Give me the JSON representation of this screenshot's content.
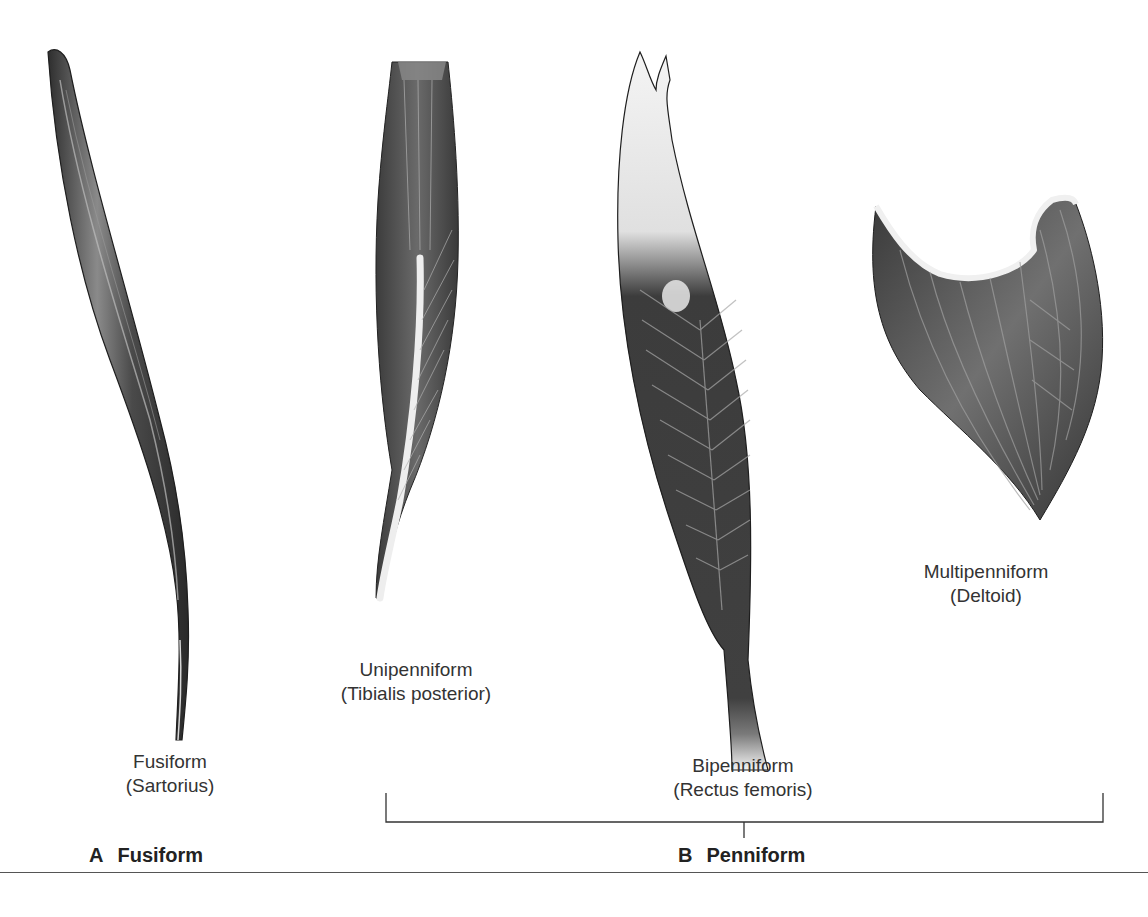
{
  "figure": {
    "muscles": [
      {
        "id": "fusiform",
        "name": "Fusiform",
        "example": "(Sartorius)"
      },
      {
        "id": "unipenniform",
        "name": "Unipenniform",
        "example": "(Tibialis posterior)"
      },
      {
        "id": "bipenniform",
        "name": "Bipenniform",
        "example": "(Rectus femoris)"
      },
      {
        "id": "multipenniform",
        "name": "Multipenniform",
        "example": "(Deltoid)"
      }
    ],
    "panels": [
      {
        "letter": "A",
        "title": "Fusiform"
      },
      {
        "letter": "B",
        "title": "Penniform"
      }
    ],
    "colors": {
      "muscle_dark": "#3a3a3a",
      "muscle_mid": "#6e6e6e",
      "tendon": "#f2f2f2",
      "line": "#333333"
    }
  }
}
